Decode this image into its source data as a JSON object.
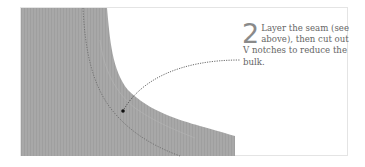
{
  "illustration": {
    "subject": "fabric-seam-corner",
    "fabric_color": "#a9a9a9",
    "stitch_color": "#555555"
  },
  "step": {
    "number": "2",
    "text": "Layer the seam (see above), then cut out V notches to reduce the bulk."
  }
}
